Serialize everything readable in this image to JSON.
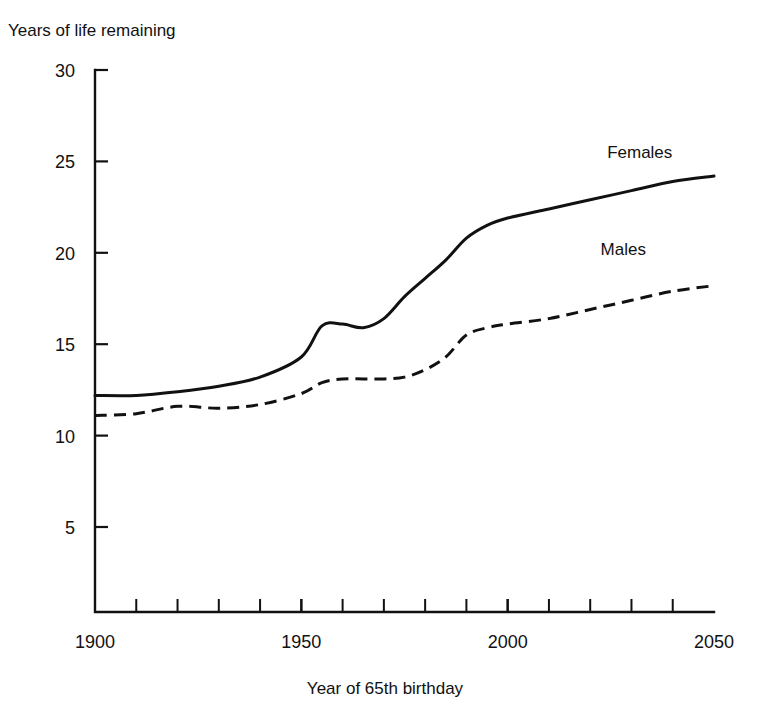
{
  "chart_data": {
    "type": "line",
    "title": "",
    "ylabel": "Years of life remaining",
    "xlabel": "Year of 65th birthday",
    "xlim": [
      1900,
      2050
    ],
    "ylim": [
      0,
      30
    ],
    "grid": false,
    "legend_position": "inline-right-end-of-line",
    "y_ticks": [
      5,
      10,
      15,
      20,
      25,
      30
    ],
    "y_tick_labels": [
      "5",
      "10",
      "15",
      "20",
      "25",
      "30"
    ],
    "x_ticks": [
      1900,
      1950,
      2000,
      2050
    ],
    "x_tick_labels": [
      "1900",
      "1950",
      "2000",
      "2050"
    ],
    "x_minor_tick_step": 10,
    "x": [
      1900,
      1910,
      1920,
      1930,
      1940,
      1950,
      1955,
      1960,
      1965,
      1970,
      1975,
      1980,
      1985,
      1990,
      1995,
      2000,
      2010,
      2020,
      2030,
      2040,
      2050
    ],
    "series": [
      {
        "name": "Females",
        "style": "solid",
        "values": [
          12.2,
          12.2,
          12.4,
          12.7,
          13.2,
          14.3,
          16.0,
          16.1,
          15.9,
          16.4,
          17.6,
          18.6,
          19.6,
          20.8,
          21.5,
          21.9,
          22.4,
          22.9,
          23.4,
          23.9,
          24.2
        ]
      },
      {
        "name": "Males",
        "style": "dashed",
        "values": [
          11.1,
          11.2,
          11.6,
          11.5,
          11.7,
          12.3,
          12.9,
          13.1,
          13.1,
          13.1,
          13.2,
          13.6,
          14.3,
          15.5,
          15.9,
          16.1,
          16.4,
          16.9,
          17.4,
          17.9,
          18.2
        ]
      }
    ],
    "annotations": [
      {
        "name": "Females",
        "text": "Females",
        "x": 2032,
        "y": 25.2
      },
      {
        "name": "Males",
        "text": "Males",
        "x": 2028,
        "y": 19.9
      }
    ]
  }
}
